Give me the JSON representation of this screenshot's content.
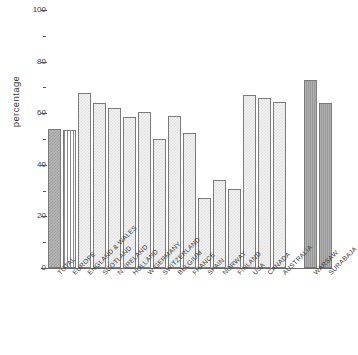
{
  "chart_data": {
    "type": "bar",
    "title": "",
    "subtitle": "",
    "xlabel": "",
    "ylabel": "percentage",
    "ylim": [
      0,
      100
    ],
    "grid": false,
    "legend": null,
    "y_ticks_major": [
      0,
      20,
      40,
      60,
      80,
      100
    ],
    "y_ticks_minor": [
      10,
      30,
      50,
      70,
      90
    ],
    "y_tick_labels": [
      "0",
      "20",
      "40",
      "60",
      "80",
      "100"
    ],
    "categories": [
      "TOTAL",
      "EUROPE",
      "ENGLAND & WALES",
      "SCOTLAND",
      "N. IRELAND",
      "HOLLAND",
      "W-GERMANY",
      "SWITZERLAND",
      "BELGIUM",
      "FRANCE",
      "SPAIN",
      "NORWAY",
      "FINLAND",
      "USA",
      "CANADA",
      "AUSTRALIA",
      "WARSAW",
      "SURABAJA"
    ],
    "values": [
      54,
      53.5,
      68,
      64,
      62,
      58.5,
      60.5,
      50,
      59,
      52.5,
      27,
      34,
      30.5,
      67,
      66,
      64.5,
      73,
      64
    ],
    "bar_styles": [
      "checkered",
      "vertical-stripes",
      "light-dotted",
      "light-dotted",
      "light-dotted",
      "light-dotted",
      "light-dotted",
      "light-dotted",
      "light-dotted",
      "light-dotted",
      "light-dotted",
      "light-dotted",
      "light-dotted",
      "light-dotted",
      "light-dotted",
      "light-dotted",
      "solid-gray",
      "solid-gray"
    ],
    "group_gap_after_index": 15,
    "colors": {
      "axis": "#555555",
      "bar_outline": "#7b7b7b",
      "bar_light": "#f2f2f2",
      "bar_checkered": "#b9b9b9",
      "bar_solid": "#9e9e9e",
      "text": "#3a3a3a",
      "background": "#ffffff"
    }
  }
}
